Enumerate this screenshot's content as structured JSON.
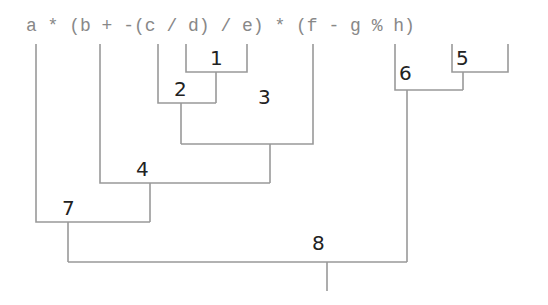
{
  "diagram": {
    "expression": "a * (b + -(c / d) / e) * (f - g % h)",
    "expression_tokens": [
      "a",
      "*",
      "(b",
      "+",
      "-(c",
      "/",
      "d)",
      "/",
      "e)",
      "*",
      "(f",
      "-",
      "g",
      "%",
      "h)"
    ],
    "evaluation_order_labels": [
      "1",
      "2",
      "3",
      "4",
      "5",
      "6",
      "7",
      "8"
    ],
    "steps": [
      {
        "label": "1",
        "operation": "c / d"
      },
      {
        "label": "2",
        "operation": "-(c / d)"
      },
      {
        "label": "3",
        "operation": "-(c / d) / e"
      },
      {
        "label": "4",
        "operation": "b + -(c / d) / e"
      },
      {
        "label": "5",
        "operation": "g % h"
      },
      {
        "label": "6",
        "operation": "f - g % h"
      },
      {
        "label": "7",
        "operation": "a * (b + -(c / d) / e)"
      },
      {
        "label": "8",
        "operation": "a * (b + -(c / d) / e) * (f - g % h)"
      }
    ],
    "colors": {
      "expression": "#888888",
      "labels": "#222222",
      "lines": "#999999"
    }
  }
}
